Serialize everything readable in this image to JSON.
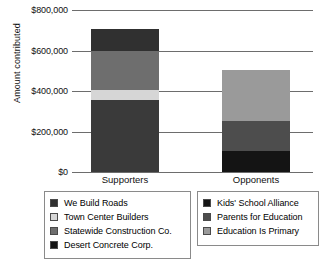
{
  "chart_data": {
    "type": "bar",
    "subtype": "stacked",
    "title": "",
    "xlabel": "",
    "ylabel": "Amount contributed",
    "categories": [
      "Supporters",
      "Opponents"
    ],
    "ylim": [
      0,
      800000
    ],
    "yticks": [
      0,
      200000,
      400000,
      600000,
      800000
    ],
    "ytick_labels": [
      "$0",
      "$200,000",
      "$400,000",
      "$600,000",
      "$800,000"
    ],
    "grid": true,
    "legend_position": "bottom",
    "series": [
      {
        "name": "Desert Concrete Corp.",
        "category": "Supporters",
        "value": 355000,
        "color": "#3a3a3a"
      },
      {
        "name": "Town Center Builders",
        "category": "Supporters",
        "value": 50000,
        "color": "#d6d6d6"
      },
      {
        "name": "Statewide Construction Co.",
        "category": "Supporters",
        "value": 195000,
        "color": "#6e6e6e"
      },
      {
        "name": "We Build Roads",
        "category": "Supporters",
        "value": 105000,
        "color": "#303030"
      },
      {
        "name": "Kids' School Alliance",
        "category": "Opponents",
        "value": 105000,
        "color": "#141414"
      },
      {
        "name": "Parents for Education",
        "category": "Opponents",
        "value": 145000,
        "color": "#4d4d4d"
      },
      {
        "name": "Education Is Primary",
        "category": "Opponents",
        "value": 255000,
        "color": "#9a9a9a"
      }
    ],
    "totals": {
      "Supporters": 705000,
      "Opponents": 505000
    }
  },
  "axis": {
    "y_title": "Amount contributed",
    "ticks": [
      {
        "label": "$800,000",
        "value": 800000
      },
      {
        "label": "$600,000",
        "value": 600000
      },
      {
        "label": "$400,000",
        "value": 400000
      },
      {
        "label": "$200,000",
        "value": 200000
      },
      {
        "label": "$0",
        "value": 0
      }
    ]
  },
  "categories": [
    {
      "label": "Supporters"
    },
    {
      "label": "Opponents"
    }
  ],
  "bars": {
    "supporters": {
      "label": "Supporters",
      "total": 705000,
      "segments": [
        {
          "label": "We Build Roads",
          "value": 105000,
          "color": "#303030"
        },
        {
          "label": "Statewide Construction Co.",
          "value": 195000,
          "color": "#6e6e6e"
        },
        {
          "label": "Town Center Builders",
          "value": 50000,
          "color": "#d6d6d6"
        },
        {
          "label": "Desert Concrete Corp.",
          "value": 355000,
          "color": "#3a3a3a"
        }
      ]
    },
    "opponents": {
      "label": "Opponents",
      "total": 505000,
      "segments": [
        {
          "label": "Education Is Primary",
          "value": 255000,
          "color": "#9a9a9a"
        },
        {
          "label": "Parents for Education",
          "value": 145000,
          "color": "#4d4d4d"
        },
        {
          "label": "Kids' School Alliance",
          "value": 105000,
          "color": "#141414"
        }
      ]
    }
  },
  "legends": {
    "left": {
      "items": [
        {
          "label": "We Build Roads",
          "color": "#303030"
        },
        {
          "label": "Town Center Builders",
          "color": "#d6d6d6"
        },
        {
          "label": "Statewide Construction Co.",
          "color": "#6e6e6e"
        },
        {
          "label": "Desert Concrete Corp.",
          "color": "#141414"
        }
      ]
    },
    "right": {
      "items": [
        {
          "label": "Kids' School Alliance",
          "color": "#141414"
        },
        {
          "label": "Parents for Education",
          "color": "#4d4d4d"
        },
        {
          "label": "Education Is Primary",
          "color": "#9a9a9a"
        }
      ]
    }
  }
}
